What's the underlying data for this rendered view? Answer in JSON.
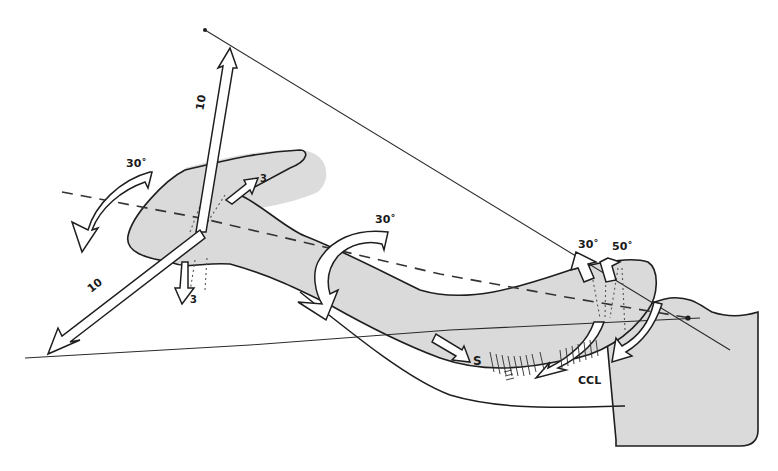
{
  "figure": {
    "colors": {
      "bone_fill": "#dadada",
      "line": "#1e1e1e",
      "background": "#ffffff"
    },
    "labels": {
      "translation_vertical": "10",
      "translation_anteroposterior": "10",
      "translation_small_up": "3",
      "translation_small_down": "3",
      "rotation_lateral_end": "30˚",
      "rotation_shaft": "30˚",
      "rotation_medial_a": "30˚",
      "rotation_medial_b": "50˚",
      "subclavius_label": "S",
      "ligament_label": "CCL"
    }
  }
}
